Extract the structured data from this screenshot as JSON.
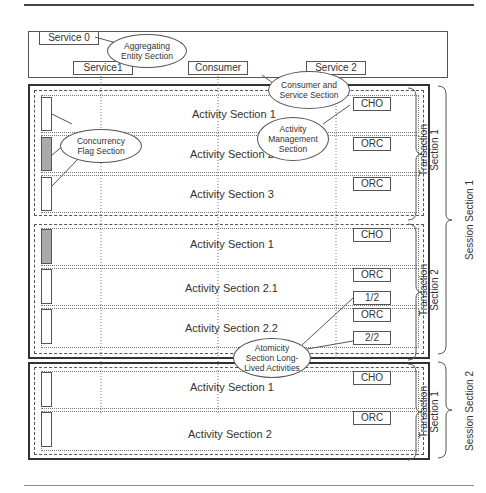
{
  "aggregating_entity": {
    "services": [
      {
        "label": "Service 0"
      },
      {
        "label": "Service1"
      },
      {
        "label": "Consumer"
      },
      {
        "label": "Service 2"
      }
    ]
  },
  "callouts": {
    "aggregating_entity": "Aggregating Entity Section",
    "consumer_service": "Consumer and Service Section",
    "concurrency_flag": "Concurrency Flag Section",
    "activity_management": "Activity Management Section",
    "atomicity": "Atomicity Section Long-Lived Activities"
  },
  "session_1": {
    "label": "Session Section 1",
    "transactions": [
      {
        "label_line1": "Transaction",
        "label_line2": "Section 1",
        "activities": [
          {
            "label": "Activity Section 1",
            "tag": "CHO",
            "flag_on": false
          },
          {
            "label": "Activity Section 2",
            "tag": "ORC",
            "flag_on": true
          },
          {
            "label": "Activity Section 3",
            "tag": "ORC",
            "flag_on": false
          }
        ]
      },
      {
        "label_line1": "Transaction",
        "label_line2": "Section 2",
        "activities": [
          {
            "label": "Activity Section 1",
            "tag": "CHO",
            "flag_on": true
          },
          {
            "label": "Activity Section 2.1",
            "tag": "ORC",
            "extra_tag": "1/2",
            "flag_on": false
          },
          {
            "label": "Activity Section 2.2",
            "tag": "ORC",
            "extra_tag": "2/2",
            "flag_on": false
          }
        ]
      }
    ]
  },
  "session_2": {
    "label": "Session Section 2",
    "transactions": [
      {
        "label_line1": "Transaction",
        "label_line2": "Section 1",
        "activities": [
          {
            "label": "Activity Section 1",
            "tag": "CHO",
            "flag_on": false
          },
          {
            "label": "Activity Section 2",
            "tag": "ORC",
            "flag_on": false
          }
        ]
      }
    ]
  }
}
